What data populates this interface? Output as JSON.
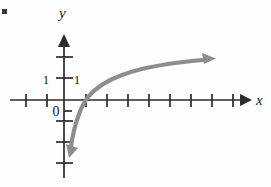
{
  "figure": {
    "kind": "coordinate-graph",
    "background_color": "#fefefe",
    "bullet_marker": {
      "label": "▪",
      "x": 4,
      "y": 11,
      "color": "#3a3a3a"
    },
    "axes": {
      "axis_color": "#2b2b2b",
      "origin": {
        "x": 64,
        "y": 100
      },
      "tick_spacing": 21,
      "x_axis": {
        "label": "x",
        "label_x": 258,
        "label_y": 104,
        "start_x": 10,
        "end_x": 252,
        "y": 100,
        "arrow": "right",
        "ticks": [
          26,
          47,
          86,
          107,
          128,
          149,
          170,
          191,
          212,
          233
        ],
        "tick_half_height": 6
      },
      "y_axis": {
        "label": "y",
        "label_x": 59,
        "label_y": 17,
        "x": 64,
        "start_y": 178,
        "end_y": 34,
        "arrow": "up",
        "ticks": [
          57,
          78,
          121,
          142,
          163
        ],
        "tick_half_width": 8,
        "short_ticks": [
          111
        ],
        "short_tick_width": 5
      },
      "tick_labels": [
        {
          "text": "1",
          "x": 46,
          "y": 84,
          "anchor": "middle"
        },
        {
          "text": "1",
          "x": 77,
          "y": 84,
          "anchor": "middle"
        },
        {
          "text": "0",
          "x": 56,
          "y": 116,
          "anchor": "middle"
        }
      ]
    },
    "curve": {
      "name": "logarithmic-curve",
      "color": "#8d8d8d",
      "stroke_width": 4.2,
      "x_intercept": 86,
      "path": "M 70.5 150 C 72 138, 74.5 126, 79 114 C 82 106, 84.5 101.5, 88.5 96.5 C 96 87.5, 107 80.5, 122 75 C 142 67.5, 170 62.5, 208 59.5",
      "arrow_start": {
        "x": 69,
        "y": 158,
        "direction": "down"
      },
      "arrow_end": {
        "x": 216,
        "y": 59,
        "direction": "right-up"
      }
    }
  },
  "chart_data": {
    "type": "line",
    "title": "",
    "xlabel": "x",
    "ylabel": "y",
    "x_intercept": 1,
    "tick_labels_x": [
      "1"
    ],
    "tick_labels_y": [
      "1"
    ],
    "origin_label": "0",
    "grid": false,
    "legend": "none"
  }
}
